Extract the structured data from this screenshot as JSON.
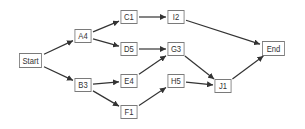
{
  "diagram": {
    "type": "network-flow",
    "colors": {
      "edge": "#333333",
      "border": "#7a7a7a",
      "text": "#333333"
    },
    "nodes": [
      {
        "id": "Start",
        "label": "Start",
        "x": 17,
        "y": 53,
        "w": 27,
        "h": 15
      },
      {
        "id": "A4",
        "label": "A4",
        "x": 73,
        "y": 29,
        "w": 20,
        "h": 14
      },
      {
        "id": "B3",
        "label": "B3",
        "x": 73,
        "y": 78,
        "w": 20,
        "h": 14
      },
      {
        "id": "C1",
        "label": "C1",
        "x": 119,
        "y": 10,
        "w": 20,
        "h": 14
      },
      {
        "id": "D5",
        "label": "D5",
        "x": 119,
        "y": 42,
        "w": 20,
        "h": 14
      },
      {
        "id": "E4",
        "label": "E4",
        "x": 119,
        "y": 74,
        "w": 20,
        "h": 14
      },
      {
        "id": "F1",
        "label": "F1",
        "x": 119,
        "y": 105,
        "w": 20,
        "h": 14
      },
      {
        "id": "I2",
        "label": "I2",
        "x": 166,
        "y": 10,
        "w": 20,
        "h": 14
      },
      {
        "id": "G3",
        "label": "G3",
        "x": 166,
        "y": 42,
        "w": 20,
        "h": 14
      },
      {
        "id": "H5",
        "label": "H5",
        "x": 166,
        "y": 74,
        "w": 20,
        "h": 14
      },
      {
        "id": "J1",
        "label": "J1",
        "x": 213,
        "y": 79,
        "w": 20,
        "h": 14
      },
      {
        "id": "End",
        "label": "End",
        "x": 260,
        "y": 41,
        "w": 27,
        "h": 15
      }
    ],
    "edges": [
      {
        "from": "Start",
        "to": "A4"
      },
      {
        "from": "Start",
        "to": "B3"
      },
      {
        "from": "A4",
        "to": "C1"
      },
      {
        "from": "A4",
        "to": "D5"
      },
      {
        "from": "B3",
        "to": "E4"
      },
      {
        "from": "B3",
        "to": "F1"
      },
      {
        "from": "C1",
        "to": "I2"
      },
      {
        "from": "D5",
        "to": "G3"
      },
      {
        "from": "E4",
        "to": "G3"
      },
      {
        "from": "F1",
        "to": "H5"
      },
      {
        "from": "G3",
        "to": "J1"
      },
      {
        "from": "H5",
        "to": "J1"
      },
      {
        "from": "I2",
        "to": "End"
      },
      {
        "from": "J1",
        "to": "End"
      }
    ]
  }
}
